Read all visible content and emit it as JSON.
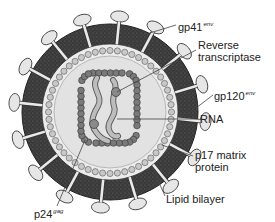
{
  "figure": {
    "colors": {
      "envelope": "#3a3a3a",
      "envelope_speckle": "#6a6a6a",
      "interior": "#e2e2e2",
      "matrix_bead": "#c8c8c8",
      "capsid_bead": "#7a7a7a",
      "knob": "#e6e6e6",
      "rna": "#b5b5b5",
      "leader_line": "#444444"
    }
  },
  "labels": {
    "gp41": {
      "main": "gp41",
      "sup": "env"
    },
    "reverse_transcriptase": {
      "line1": "Reverse",
      "line2": "transcriptase"
    },
    "gp120": {
      "main": "gp120",
      "sup": "env"
    },
    "rna": {
      "main": "RNA"
    },
    "p17": {
      "line1": "p17 matrix",
      "line2": "protein"
    },
    "lipid_bilayer": {
      "main": "Lipid bilayer"
    },
    "p24": {
      "main": "p24",
      "sup": "gag"
    }
  }
}
